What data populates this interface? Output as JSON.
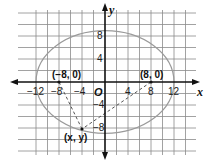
{
  "diagram": {
    "type": "coordinate-plane-ellipse",
    "axes": {
      "x_label": "x",
      "y_label": "y",
      "origin_label": "O",
      "x_ticks": [
        "−12",
        "−8",
        "−4",
        "4",
        "8",
        "12"
      ],
      "y_ticks": [
        "8",
        "4",
        "−4",
        "−8"
      ],
      "x_tick_values": [
        -12,
        -8,
        -4,
        4,
        8,
        12
      ],
      "y_tick_values": [
        8,
        4,
        -4,
        -8
      ],
      "grid_step": 2,
      "x_range": [
        -13,
        14
      ],
      "y_range": [
        -12,
        14
      ]
    },
    "ellipse": {
      "center": [
        0,
        0
      ],
      "semi_major_x": 12,
      "semi_minor_y": 8.94
    },
    "foci": [
      {
        "label": "(−8, 0)",
        "x": -8,
        "y": 0
      },
      {
        "label": "(8, 0)",
        "x": 8,
        "y": 0
      }
    ],
    "point": {
      "label": "(x, y)",
      "x": -4,
      "y": -8.2
    },
    "colors": {
      "grid": "#8a8a8a",
      "axis": "#111111",
      "ellipse": "#9a9a9a",
      "dashed": "#555555"
    }
  }
}
